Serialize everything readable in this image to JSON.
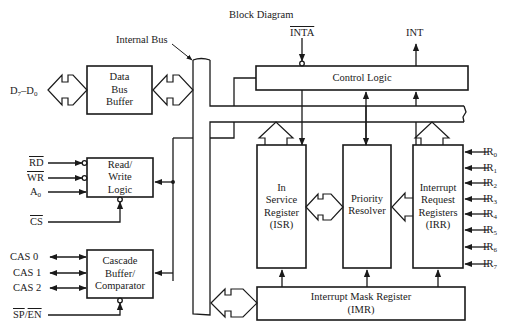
{
  "title": "Block Diagram",
  "internal_bus_label": "Internal Bus",
  "blocks": {
    "data_bus_buffer": [
      "Data",
      "Bus",
      "Buffer"
    ],
    "read_write_logic": [
      "Read/",
      "Write",
      "Logic"
    ],
    "cascade_buffer": [
      "Cascade",
      "Buffer/",
      "Comparator"
    ],
    "control_logic": "Control Logic",
    "isr": [
      "In",
      "Service",
      "Register",
      "(ISR)"
    ],
    "priority_resolver": [
      "Priority",
      "Resolver"
    ],
    "irr": [
      "Interrupt",
      "Request",
      "Registers",
      "(IRR)"
    ],
    "imr": [
      "Interrupt Mask Register",
      "(IMR)"
    ]
  },
  "signals": {
    "data_bus": {
      "main": "D",
      "sub1": "7",
      "sep": "–D",
      "sub2": "0"
    },
    "rd": "RD",
    "wr": "WR",
    "a0": {
      "main": "A",
      "sub": "0"
    },
    "cs": "CS",
    "cas": [
      "CAS 0",
      "CAS 1",
      "CAS 2"
    ],
    "sp_en": {
      "a": "SP",
      "sep": "/",
      "b": "EN"
    },
    "inta": "INTA",
    "int": "INT",
    "ir": [
      {
        "main": "IR",
        "sub": "0"
      },
      {
        "main": "IR",
        "sub": "1"
      },
      {
        "main": "IR",
        "sub": "2"
      },
      {
        "main": "IR",
        "sub": "3"
      },
      {
        "main": "IR",
        "sub": "4"
      },
      {
        "main": "IR",
        "sub": "5"
      },
      {
        "main": "IR",
        "sub": "6"
      },
      {
        "main": "IR",
        "sub": "7"
      }
    ]
  },
  "colors": {
    "line": "#1a1a1a",
    "background": "#ffffff"
  }
}
